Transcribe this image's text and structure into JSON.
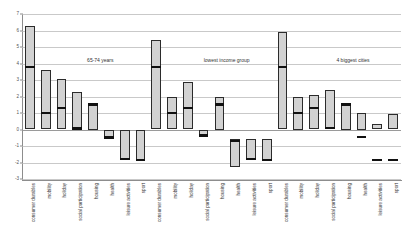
{
  "chart_data": {
    "type": "bar",
    "title": "",
    "subtitle": "",
    "xlabel": "",
    "ylabel": "",
    "ylim": [
      -3,
      7
    ],
    "yticks": [
      7,
      6,
      5,
      4,
      3,
      2,
      1,
      0,
      -1,
      -2,
      -3
    ],
    "grid": true,
    "legend": "none",
    "categories": [
      "consumer durables",
      "mobility",
      "holiday",
      "social participation",
      "housing",
      "health",
      "leisure activities",
      "sport"
    ],
    "panels": [
      {
        "name": "65-74 years",
        "bars": [
          {
            "category": "consumer durables",
            "low": 0.0,
            "high": 6.3,
            "median": 3.8
          },
          {
            "category": "mobility",
            "low": 0.0,
            "high": 3.6,
            "median": 1.0
          },
          {
            "category": "holiday",
            "low": 0.0,
            "high": 3.05,
            "median": 1.3
          },
          {
            "category": "social participation",
            "low": 0.0,
            "high": 2.3,
            "median": 0.05
          },
          {
            "category": "housing",
            "low": 0.0,
            "high": 1.5,
            "median": 1.5
          },
          {
            "category": "health",
            "low": -0.55,
            "high": 0.0,
            "median": -0.5
          },
          {
            "category": "leisure activities",
            "low": -1.8,
            "high": 0.0,
            "median": -1.8
          },
          {
            "category": "sport",
            "low": -1.85,
            "high": 0.0,
            "median": -1.85
          }
        ]
      },
      {
        "name": "lowest income group",
        "bars": [
          {
            "category": "consumer durables",
            "low": 0.0,
            "high": 5.4,
            "median": 3.8
          },
          {
            "category": "mobility",
            "low": 0.0,
            "high": 1.95,
            "median": 1.0
          },
          {
            "category": "holiday",
            "low": 0.0,
            "high": 2.85,
            "median": 1.3
          },
          {
            "category": "social participation",
            "low": -0.4,
            "high": 0.0,
            "median": -0.35
          },
          {
            "category": "housing",
            "low": 0.0,
            "high": 2.0,
            "median": 1.5
          },
          {
            "category": "health",
            "low": -2.3,
            "high": -0.6,
            "median": -0.7
          },
          {
            "category": "leisure activities",
            "low": -1.85,
            "high": -0.6,
            "median": -1.8
          },
          {
            "category": "sport",
            "low": -1.85,
            "high": -0.6,
            "median": -1.85
          }
        ]
      },
      {
        "name": "4 biggest cities",
        "bars": [
          {
            "category": "consumer durables",
            "low": 0.0,
            "high": 5.9,
            "median": 3.8
          },
          {
            "category": "mobility",
            "low": 0.0,
            "high": 2.0,
            "median": 1.0
          },
          {
            "category": "holiday",
            "low": 0.0,
            "high": 2.1,
            "median": 1.3
          },
          {
            "category": "social participation",
            "low": 0.0,
            "high": 2.4,
            "median": 0.1
          },
          {
            "category": "housing",
            "low": 0.0,
            "high": 1.5,
            "median": 1.5
          },
          {
            "category": "health",
            "low": 0.0,
            "high": 1.0,
            "median": -0.45
          },
          {
            "category": "leisure activities",
            "low": 0.0,
            "high": 0.35,
            "median": -1.85
          },
          {
            "category": "sport",
            "low": 0.0,
            "high": 0.95,
            "median": -1.85
          }
        ]
      }
    ]
  }
}
